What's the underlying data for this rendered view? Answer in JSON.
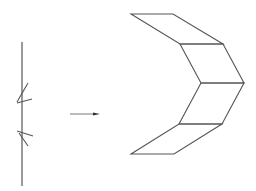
{
  "diagram": {
    "colors": {
      "background": "#ffffff",
      "stroke": "#555555",
      "arrow": "#333333"
    },
    "left_figure": {
      "name": "vertical-line-with-ticks",
      "line": {
        "x1": 22,
        "y1": 42,
        "x2": 22,
        "y2": 186
      },
      "ticks": [
        {
          "x1": 28,
          "y1": 83,
          "x2": 17,
          "y2": 102
        },
        {
          "x1": 17,
          "y1": 103,
          "x2": 32,
          "y2": 99
        },
        {
          "x1": 17,
          "y1": 131,
          "x2": 33,
          "y2": 136
        },
        {
          "x1": 19,
          "y1": 133,
          "x2": 28,
          "y2": 146
        }
      ]
    },
    "arrow": {
      "x1": 70,
      "y1": 114,
      "x2": 100,
      "y2": 114,
      "direction": "right"
    },
    "right_figure": {
      "name": "chevron-strip",
      "parallelograms": [
        {
          "name": "top-panel",
          "points": [
            [
              131,
              14
            ],
            [
              173,
              14
            ],
            [
              223,
              44
            ],
            [
              180,
              44
            ]
          ]
        },
        {
          "name": "upper-middle-panel",
          "points": [
            [
              180,
              44
            ],
            [
              223,
              44
            ],
            [
              244,
              83
            ],
            [
              201,
              83
            ]
          ]
        },
        {
          "name": "lower-middle-panel",
          "points": [
            [
              201,
              83
            ],
            [
              244,
              83
            ],
            [
              222,
              124
            ],
            [
              179,
              124
            ]
          ]
        },
        {
          "name": "bottom-panel",
          "points": [
            [
              179,
              124
            ],
            [
              222,
              124
            ],
            [
              174,
              154
            ],
            [
              131,
              154
            ]
          ]
        }
      ]
    }
  }
}
